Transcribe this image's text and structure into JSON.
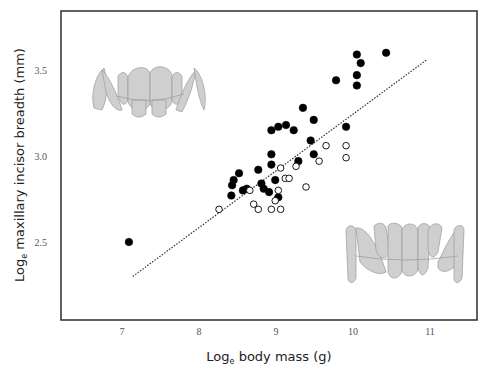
{
  "chart_data": {
    "type": "scatter",
    "title": "",
    "xlabel": "Log_e body mass (g)",
    "ylabel": "Log_e maxillary incisor breadth (mm)",
    "xlabel_parts": {
      "pre": "Log",
      "sub": "e",
      "post": " body mass (g)"
    },
    "ylabel_parts": {
      "pre": "Log",
      "sub": "e",
      "post": " maxillary incisor breadth (mm)"
    },
    "x_ticks": [
      7,
      8,
      9,
      10,
      11
    ],
    "x_tick_labels": [
      "7",
      "8",
      "9",
      "10",
      "11"
    ],
    "y_ticks": [
      2.5,
      3.0,
      3.5
    ],
    "y_tick_labels": [
      "2.5",
      "3.0",
      "3.5"
    ],
    "xlim": [
      6.22,
      11.6
    ],
    "ylim": [
      2.03,
      3.83
    ],
    "grid": false,
    "legend": null,
    "series": [
      {
        "name": "filled",
        "marker": "filled-circle",
        "color": "#000000",
        "points": [
          [
            7.09,
            2.5
          ],
          [
            8.43,
            2.83
          ],
          [
            8.42,
            2.77
          ],
          [
            8.45,
            2.86
          ],
          [
            8.52,
            2.9
          ],
          [
            8.57,
            2.8
          ],
          [
            8.62,
            2.81
          ],
          [
            8.77,
            2.92
          ],
          [
            8.81,
            2.84
          ],
          [
            8.84,
            2.81
          ],
          [
            8.91,
            2.79
          ],
          [
            8.94,
            2.95
          ],
          [
            8.94,
            3.01
          ],
          [
            8.94,
            3.15
          ],
          [
            9.03,
            3.17
          ],
          [
            9.13,
            3.18
          ],
          [
            9.23,
            3.15
          ],
          [
            8.99,
            2.86
          ],
          [
            9.03,
            2.76
          ],
          [
            9.35,
            3.28
          ],
          [
            9.49,
            3.21
          ],
          [
            9.45,
            3.09
          ],
          [
            9.49,
            3.01
          ],
          [
            9.29,
            2.97
          ],
          [
            9.91,
            3.17
          ],
          [
            9.78,
            3.44
          ],
          [
            10.05,
            3.59
          ],
          [
            10.1,
            3.54
          ],
          [
            10.05,
            3.47
          ],
          [
            10.05,
            3.41
          ],
          [
            10.43,
            3.6
          ]
        ]
      },
      {
        "name": "open",
        "marker": "open-circle",
        "color": "#000000",
        "points": [
          [
            8.26,
            2.69
          ],
          [
            8.66,
            2.8
          ],
          [
            8.71,
            2.72
          ],
          [
            8.77,
            2.69
          ],
          [
            8.94,
            2.69
          ],
          [
            9.06,
            2.69
          ],
          [
            8.99,
            2.74
          ],
          [
            9.03,
            2.8
          ],
          [
            9.06,
            2.93
          ],
          [
            9.12,
            2.87
          ],
          [
            9.17,
            2.87
          ],
          [
            9.26,
            2.94
          ],
          [
            9.39,
            2.82
          ],
          [
            9.56,
            2.97
          ],
          [
            9.65,
            3.06
          ],
          [
            9.91,
            3.06
          ],
          [
            9.91,
            2.99
          ]
        ]
      }
    ],
    "fit_line": {
      "style": "dotted",
      "color": "#333333",
      "x": [
        7.14,
        10.96
      ],
      "y": [
        2.3,
        3.56
      ]
    },
    "annotations": [
      {
        "type": "illustration",
        "name": "upper-dentition-small",
        "position": "top-left"
      },
      {
        "type": "illustration",
        "name": "upper-dentition-large",
        "position": "bottom-right"
      }
    ]
  }
}
